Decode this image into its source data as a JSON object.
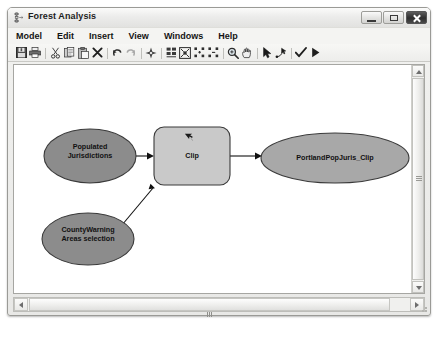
{
  "window": {
    "title": "Forest Analysis",
    "title_icon": "model-builder-icon",
    "controls": {
      "minimize": "Minimize",
      "maximize": "Maximize",
      "close": "Close"
    }
  },
  "menubar": {
    "items": [
      {
        "label": "Model"
      },
      {
        "label": "Edit"
      },
      {
        "label": "Insert"
      },
      {
        "label": "View"
      },
      {
        "label": "Windows"
      },
      {
        "label": "Help"
      }
    ]
  },
  "toolbar": {
    "buttons": [
      {
        "name": "save-icon",
        "tip": "Save"
      },
      {
        "name": "print-icon",
        "tip": "Print"
      },
      {
        "name": "cut-icon",
        "tip": "Cut"
      },
      {
        "name": "copy-icon",
        "tip": "Copy"
      },
      {
        "name": "paste-icon",
        "tip": "Paste"
      },
      {
        "name": "delete-icon",
        "tip": "Delete"
      },
      {
        "name": "undo-icon",
        "tip": "Undo"
      },
      {
        "name": "redo-icon",
        "tip": "Redo"
      },
      {
        "name": "add-data-icon",
        "tip": "Add Data or Tool"
      },
      {
        "name": "auto-layout-icon",
        "tip": "Auto Layout"
      },
      {
        "name": "full-extent-icon",
        "tip": "Full Extent"
      },
      {
        "name": "zoom-in-fixed-icon",
        "tip": "Fixed Zoom In"
      },
      {
        "name": "zoom-out-fixed-icon",
        "tip": "Fixed Zoom Out"
      },
      {
        "name": "zoom-icon",
        "tip": "Zoom In"
      },
      {
        "name": "pan-icon",
        "tip": "Pan"
      },
      {
        "name": "select-icon",
        "tip": "Select"
      },
      {
        "name": "connect-icon",
        "tip": "Connect"
      },
      {
        "name": "validate-icon",
        "tip": "Validate Entire Model"
      },
      {
        "name": "run-icon",
        "tip": "Run"
      }
    ]
  },
  "model": {
    "nodes": [
      {
        "id": "populated-jurisdictions",
        "type": "data-variable",
        "shape": "ellipse",
        "label": "Populated\nJurisdictions",
        "fill": "#8c8c8c",
        "stroke": "#3a3a3a",
        "x": 30,
        "y": 64,
        "w": 92,
        "h": 54
      },
      {
        "id": "clip",
        "type": "tool",
        "shape": "rounded-rect",
        "label": "Clip",
        "fill": "#c9c9c9",
        "stroke": "#3a3a3a",
        "x": 140,
        "y": 62,
        "w": 76,
        "h": 58
      },
      {
        "id": "portlandpopjuris-clip",
        "type": "derived-variable",
        "shape": "ellipse",
        "label": "PortlandPopJuris_Clip",
        "fill": "#a8a8a8",
        "stroke": "#3a3a3a",
        "x": 247,
        "y": 68,
        "w": 148,
        "h": 50
      },
      {
        "id": "countywarning-areas-selection",
        "type": "data-variable",
        "shape": "ellipse",
        "label": "CountyWarning\nAreas selection",
        "fill": "#8c8c8c",
        "stroke": "#3a3a3a",
        "x": 28,
        "y": 148,
        "w": 92,
        "h": 52
      }
    ],
    "connectors": [
      {
        "from": "populated-jurisdictions",
        "to": "clip",
        "arrow": true
      },
      {
        "from": "countywarning-areas-selection",
        "to": "clip",
        "arrow": true
      },
      {
        "from": "clip",
        "to": "portlandpopjuris-clip",
        "arrow": true
      }
    ],
    "cursor_marker": {
      "name": "pointer-marker",
      "x": 176,
      "y": 68
    }
  },
  "scrollbars": {
    "vertical": {
      "up": "Scroll up",
      "down": "Scroll down"
    },
    "horizontal": {
      "left": "Scroll left",
      "right": "Scroll right"
    }
  }
}
